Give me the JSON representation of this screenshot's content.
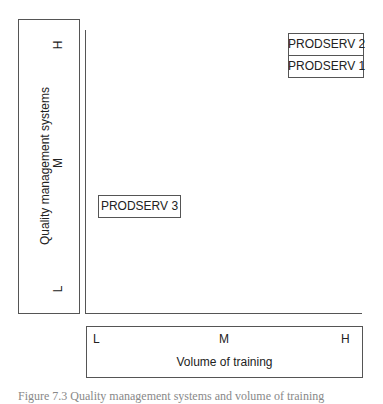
{
  "y_axis": {
    "title": "Quality management systems",
    "ticks": [
      "H",
      "M",
      "L"
    ]
  },
  "x_axis": {
    "title": "Volume of training",
    "ticks": [
      "L",
      "M",
      "H"
    ]
  },
  "items": [
    {
      "label": "PRODSERV 2",
      "x": "H",
      "y": "H"
    },
    {
      "label": "PRODSERV 1",
      "x": "H",
      "y": "H"
    },
    {
      "label": "PRODSERV 3",
      "x": "L",
      "y": "M-L"
    }
  ],
  "caption": "Figure 7.3 Quality management systems and volume of training"
}
